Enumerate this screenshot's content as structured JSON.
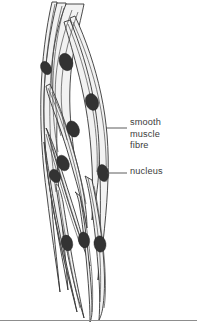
{
  "figure": {
    "background_color": "#ffffff",
    "width": 197,
    "height": 324,
    "cell_fill_color": "#f2f2f2",
    "outline_color": "#2b2b2b",
    "nucleus_color": "#333333",
    "label_color": "#3b3b3b",
    "rule_color": "#8d8d8d"
  },
  "labels": {
    "smooth_muscle_fibre": "smooth\nmuscle\nfibre",
    "nucleus": "nucleus"
  },
  "callouts": [
    {
      "name": "smooth-muscle-fibre",
      "label": "smooth muscle fibre",
      "leader_from": [
        106,
        128
      ],
      "leader_to": [
        127,
        128
      ],
      "text_anchor": [
        130,
        117
      ]
    },
    {
      "name": "nucleus",
      "label": "nucleus",
      "leader_from": [
        107,
        173
      ],
      "leader_to": [
        127,
        173
      ],
      "text_anchor": [
        130,
        166
      ]
    }
  ],
  "nuclei": [
    {
      "cx": 46,
      "cy": 68,
      "rx": 5.0,
      "ry": 7.0,
      "rot": -28
    },
    {
      "cx": 66,
      "cy": 62,
      "rx": 6.6,
      "ry": 9.0,
      "rot": -22
    },
    {
      "cx": 92,
      "cy": 102,
      "rx": 6.4,
      "ry": 8.6,
      "rot": -20
    },
    {
      "cx": 73,
      "cy": 129,
      "rx": 6.0,
      "ry": 8.4,
      "rot": -24
    },
    {
      "cx": 63,
      "cy": 163,
      "rx": 5.8,
      "ry": 8.2,
      "rot": -26
    },
    {
      "cx": 55,
      "cy": 176,
      "rx": 5.2,
      "ry": 7.0,
      "rot": -26
    },
    {
      "cx": 103,
      "cy": 173,
      "rx": 5.6,
      "ry": 8.6,
      "rot": -12
    },
    {
      "cx": 67,
      "cy": 243,
      "rx": 5.6,
      "ry": 8.0,
      "rot": -14
    },
    {
      "cx": 84,
      "cy": 240,
      "rx": 5.6,
      "ry": 8.0,
      "rot": -10
    },
    {
      "cx": 100,
      "cy": 244,
      "rx": 6.0,
      "ry": 8.2,
      "rot": -8
    }
  ],
  "structure": {
    "cell_count": 10,
    "shape": "elongated spindle fibres tapering to points at both ends",
    "orientation": "bundle running from upper-left to lower-right"
  }
}
